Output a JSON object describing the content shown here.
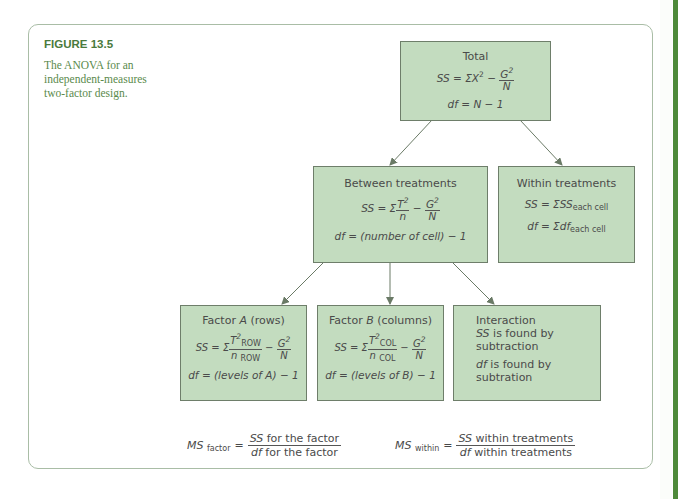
{
  "figure": {
    "title": "FIGURE 13.5",
    "caption": "The ANOVA for an independent-measures two-factor design."
  },
  "colors": {
    "box_fill": "#c3dcbf",
    "box_border": "#6e7e6a",
    "title_green": "#4a7a3c",
    "arrow": "#6a7a66",
    "side_stripe": "#4e8a3a"
  },
  "total": {
    "label": "Total",
    "ss_lhs": "SS = ΣX",
    "ss_exp": "2",
    "ss_minus": " − ",
    "g": "G",
    "g_exp": "2",
    "n": "N",
    "df": "df = N − 1"
  },
  "between": {
    "label": "Between treatments",
    "ss_lhs": "SS = Σ",
    "t": "T",
    "t_exp": "2",
    "n_small": "n",
    "minus": " − ",
    "g": "G",
    "g_exp": "2",
    "n": "N",
    "df": "df = (number of cell) − 1"
  },
  "within": {
    "label": "Within treatments",
    "ss_main": "SS = ΣSS",
    "ss_sub": "each cell",
    "df_main": "df = Σdf",
    "df_sub": "each cell"
  },
  "factor_a": {
    "label_pre": "Factor ",
    "label_var": "A",
    "label_post": " (rows)",
    "ss_lhs": "SS = Σ",
    "t": "T",
    "t_exp": "2",
    "t_sub": "ROW",
    "n_small": "n",
    "n_sub": "ROW",
    "minus": " − ",
    "g": "G",
    "g_exp": "2",
    "n": "N",
    "df": "df = (levels of A) − 1"
  },
  "factor_b": {
    "label_pre": "Factor ",
    "label_var": "B",
    "label_post": " (columns)",
    "ss_lhs": "SS = Σ",
    "t": "T",
    "t_exp": "2",
    "t_sub": "COL",
    "n_small": "n",
    "n_sub": "COL",
    "minus": " − ",
    "g": "G",
    "g_exp": "2",
    "n": "N",
    "df": "df = (levels of B) − 1"
  },
  "interaction": {
    "label": "Interaction",
    "ss_var": "SS",
    "ss_text": " is found by subtraction",
    "df_var": "df",
    "df_text": " is found by subtration"
  },
  "ms_factor": {
    "lhs": "MS",
    "lhs_sub": "factor",
    "eq": "=",
    "num_var": "SS",
    "num_text": " for the factor",
    "den_var": "df",
    "den_text": " for the factor"
  },
  "ms_within": {
    "lhs": "MS",
    "lhs_sub": "within",
    "eq": "=",
    "num_var": "SS",
    "num_text": " within treatments",
    "den_var": "df",
    "den_text": " within treatments"
  }
}
